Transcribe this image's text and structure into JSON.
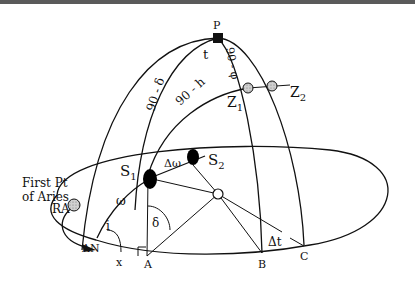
{
  "diagram": {
    "type": "celestial-sphere",
    "labels": {
      "pole": "P",
      "hour_angle": "t",
      "colatitude": "90 - φ",
      "codeclination": "90 - δ",
      "zenith_distance": "90 - h",
      "zenith1": "Z",
      "zenith1_sub": "1",
      "zenith2": "Z",
      "zenith2_sub": "2",
      "star1": "S",
      "star1_sub": "1",
      "star2": "S",
      "star2_sub": "2",
      "delta_omega": "Δω",
      "omega": "ω",
      "inclination": "i",
      "declination": "δ",
      "center": "O",
      "delta_t": "Δt",
      "ascending_node": "AN",
      "x": "x",
      "point_a": "A",
      "point_b": "B",
      "point_c": "C",
      "first_point_line1": "First Pt",
      "first_point_line2": "of Aries",
      "right_ascension": "RA"
    },
    "colors": {
      "line": "#111111",
      "marker_fill": "#c8c8c8",
      "star_fill": "#000000",
      "background": "#ffffff"
    }
  }
}
